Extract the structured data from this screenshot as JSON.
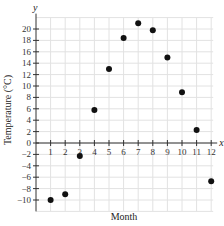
{
  "chart_data": {
    "type": "scatter",
    "title": "",
    "xlabel": "Month",
    "ylabel": "Temperature (°C)",
    "x_axis_letter": "x",
    "y_axis_letter": "y",
    "xlim": [
      0,
      12
    ],
    "ylim": [
      -12,
      22
    ],
    "grid": true,
    "x_ticks": [
      1,
      2,
      3,
      4,
      5,
      6,
      7,
      8,
      9,
      10,
      11,
      12
    ],
    "y_ticks": [
      -10,
      -8,
      -6,
      -4,
      -2,
      0,
      2,
      4,
      6,
      8,
      10,
      12,
      14,
      16,
      18,
      20
    ],
    "x": [
      1,
      2,
      3,
      4,
      5,
      6,
      7,
      8,
      9,
      10,
      11,
      12
    ],
    "y": [
      -10,
      -9,
      -2.3,
      5.8,
      13,
      18.4,
      21,
      19.8,
      15,
      8.9,
      2.3,
      -6.7
    ],
    "marker_color": "#111111"
  }
}
